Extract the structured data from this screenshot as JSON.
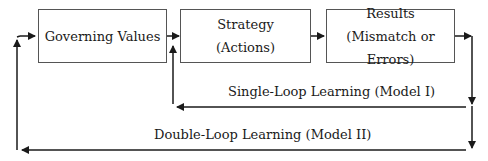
{
  "diagram": {
    "nodes": [
      {
        "id": "governing-values",
        "lines": [
          "Governing Values"
        ]
      },
      {
        "id": "strategy",
        "lines": [
          "Strategy",
          "(Actions)"
        ]
      },
      {
        "id": "results",
        "lines": [
          "Results",
          "(Mismatch or Errors)"
        ]
      }
    ],
    "loops": {
      "single": {
        "label": "Single-Loop Learning (Model I)",
        "from": "results",
        "to": "strategy"
      },
      "double": {
        "label": "Double-Loop Learning (Model II)",
        "from": "results",
        "to": "governing-values"
      }
    },
    "colors": {
      "line": "#1a1a1a",
      "border": "#555555"
    }
  }
}
